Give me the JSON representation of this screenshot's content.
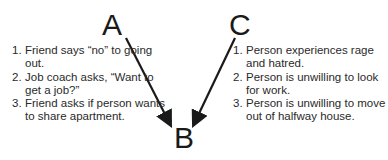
{
  "diagram": {
    "nodes": {
      "A": "A",
      "B": "B",
      "C": "C"
    },
    "edges": [
      {
        "from": "A",
        "to": "B"
      },
      {
        "from": "C",
        "to": "B"
      }
    ],
    "left_list": [
      {
        "num": "1.",
        "text": "Friend says “no” to going out."
      },
      {
        "num": "2.",
        "text": "Job coach asks, “Want to get a job?”"
      },
      {
        "num": "3.",
        "text": "Friend asks if person wants to share apartment."
      }
    ],
    "right_list": [
      {
        "num": "1.",
        "text": "Person experiences rage and hatred."
      },
      {
        "num": "2.",
        "text": "Person is unwilling to look for work."
      },
      {
        "num": "3.",
        "text": "Person is unwilling to move out of halfway house."
      }
    ],
    "colors": {
      "text": "#2a2a2a",
      "arrow": "#1a1a1a",
      "background": "#ffffff"
    }
  }
}
